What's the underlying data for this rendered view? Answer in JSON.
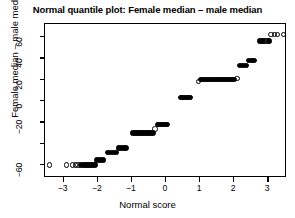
{
  "chart_data": {
    "type": "scatter",
    "title": "Normal quantile plot: Female median – male median",
    "xlabel": "Normal score",
    "ylabel": "Female median – male median",
    "xlim": [
      -3.55,
      3.55
    ],
    "ylim": [
      -72,
      72
    ],
    "grid": false,
    "legend": null,
    "xticks": [
      -3,
      -2,
      -1,
      0,
      1,
      2,
      3
    ],
    "xticklabels": [
      "−3",
      "−2",
      "−1",
      "0",
      "1",
      "2",
      "3"
    ],
    "yticks": [
      60,
      40,
      20,
      0,
      -20,
      -40,
      -60
    ],
    "yticklabels": [
      "60",
      "40",
      "20",
      "0",
      "−20",
      "",
      "−60"
    ],
    "marker": "open-circle",
    "marker_color": "#000000",
    "point_count": 118,
    "note": "Discrete response values produce horizontal bands of overlapping points forming a staircase.",
    "bands": [
      {
        "y": -60,
        "x_start": -3.42,
        "x_end": -3.42,
        "n": 1
      },
      {
        "y": -60,
        "x_start": -2.92,
        "x_end": -2.6,
        "n": 4
      },
      {
        "y": -60,
        "x_start": -2.5,
        "x_end": -2.08,
        "n": 9
      },
      {
        "y": -55,
        "x_start": -2.02,
        "x_end": -1.84,
        "n": 4
      },
      {
        "y": -48,
        "x_start": -1.72,
        "x_end": -1.46,
        "n": 5
      },
      {
        "y": -44,
        "x_start": -1.4,
        "x_end": -1.17,
        "n": 5
      },
      {
        "y": -30,
        "x_start": -0.98,
        "x_end": -0.38,
        "n": 13
      },
      {
        "y": -26,
        "x_start": -0.32,
        "x_end": -0.32,
        "n": 1
      },
      {
        "y": -22,
        "x_start": -0.25,
        "x_end": 0.05,
        "n": 7
      },
      {
        "y": 3,
        "x_start": 0.42,
        "x_end": 0.72,
        "n": 7
      },
      {
        "y": 18,
        "x_start": 0.95,
        "x_end": 0.95,
        "n": 1
      },
      {
        "y": 20,
        "x_start": 1.03,
        "x_end": 2.02,
        "n": 20
      },
      {
        "y": 21,
        "x_start": 2.08,
        "x_end": 2.08,
        "n": 1
      },
      {
        "y": 33,
        "x_start": 2.16,
        "x_end": 2.35,
        "n": 4
      },
      {
        "y": 38,
        "x_start": 2.42,
        "x_end": 2.58,
        "n": 4
      },
      {
        "y": 56,
        "x_start": 2.75,
        "x_end": 3.02,
        "n": 7
      },
      {
        "y": 60,
        "x_start": 2.86,
        "x_end": 2.98,
        "n": 3
      },
      {
        "y": 62,
        "x_start": 3.08,
        "x_end": 3.08,
        "n": 1
      },
      {
        "y": 62,
        "x_start": 3.18,
        "x_end": 3.18,
        "n": 1
      },
      {
        "y": 62,
        "x_start": 3.27,
        "x_end": 3.27,
        "n": 1
      },
      {
        "y": 62,
        "x_start": 3.45,
        "x_end": 3.45,
        "n": 1
      }
    ],
    "points": [
      {
        "x": -3.42,
        "y": -60,
        "filled": false
      },
      {
        "x": -2.92,
        "y": -60,
        "filled": false
      },
      {
        "x": -2.74,
        "y": -60,
        "filled": false
      },
      {
        "x": -2.66,
        "y": -60,
        "filled": false
      },
      {
        "x": -2.58,
        "y": -60,
        "filled": false
      },
      {
        "x": -2.5,
        "y": -60,
        "filled": true
      },
      {
        "x": -2.44,
        "y": -60,
        "filled": true
      },
      {
        "x": -2.38,
        "y": -60,
        "filled": true
      },
      {
        "x": -2.32,
        "y": -60,
        "filled": true
      },
      {
        "x": -2.26,
        "y": -60,
        "filled": true
      },
      {
        "x": -2.2,
        "y": -60,
        "filled": true
      },
      {
        "x": -2.14,
        "y": -60,
        "filled": true
      },
      {
        "x": -2.08,
        "y": -60,
        "filled": true
      },
      {
        "x": -2.02,
        "y": -55,
        "filled": true
      },
      {
        "x": -1.96,
        "y": -55,
        "filled": true
      },
      {
        "x": -1.9,
        "y": -55,
        "filled": true
      },
      {
        "x": -1.84,
        "y": -55,
        "filled": true
      },
      {
        "x": -1.72,
        "y": -48,
        "filled": true
      },
      {
        "x": -1.66,
        "y": -48,
        "filled": true
      },
      {
        "x": -1.6,
        "y": -48,
        "filled": true
      },
      {
        "x": -1.53,
        "y": -48,
        "filled": true
      },
      {
        "x": -1.46,
        "y": -48,
        "filled": true
      },
      {
        "x": -1.4,
        "y": -44,
        "filled": true
      },
      {
        "x": -1.34,
        "y": -44,
        "filled": true
      },
      {
        "x": -1.28,
        "y": -44,
        "filled": true
      },
      {
        "x": -1.22,
        "y": -44,
        "filled": true
      },
      {
        "x": -1.17,
        "y": -44,
        "filled": true
      },
      {
        "x": -0.98,
        "y": -30,
        "filled": true
      },
      {
        "x": -0.93,
        "y": -30,
        "filled": true
      },
      {
        "x": -0.88,
        "y": -30,
        "filled": true
      },
      {
        "x": -0.83,
        "y": -30,
        "filled": true
      },
      {
        "x": -0.78,
        "y": -30,
        "filled": true
      },
      {
        "x": -0.73,
        "y": -30,
        "filled": true
      },
      {
        "x": -0.68,
        "y": -30,
        "filled": true
      },
      {
        "x": -0.63,
        "y": -30,
        "filled": true
      },
      {
        "x": -0.58,
        "y": -30,
        "filled": true
      },
      {
        "x": -0.53,
        "y": -30,
        "filled": true
      },
      {
        "x": -0.48,
        "y": -30,
        "filled": true
      },
      {
        "x": -0.43,
        "y": -30,
        "filled": true
      },
      {
        "x": -0.38,
        "y": -30,
        "filled": true
      },
      {
        "x": -0.32,
        "y": -26,
        "filled": false
      },
      {
        "x": -0.25,
        "y": -22,
        "filled": true
      },
      {
        "x": -0.2,
        "y": -22,
        "filled": true
      },
      {
        "x": -0.15,
        "y": -22,
        "filled": true
      },
      {
        "x": -0.1,
        "y": -22,
        "filled": true
      },
      {
        "x": -0.05,
        "y": -22,
        "filled": true
      },
      {
        "x": 0.0,
        "y": -22,
        "filled": true
      },
      {
        "x": 0.05,
        "y": -22,
        "filled": true
      },
      {
        "x": 0.42,
        "y": 3,
        "filled": true
      },
      {
        "x": 0.47,
        "y": 3,
        "filled": true
      },
      {
        "x": 0.52,
        "y": 3,
        "filled": true
      },
      {
        "x": 0.57,
        "y": 3,
        "filled": true
      },
      {
        "x": 0.62,
        "y": 3,
        "filled": true
      },
      {
        "x": 0.67,
        "y": 3,
        "filled": true
      },
      {
        "x": 0.72,
        "y": 3,
        "filled": true
      },
      {
        "x": 0.95,
        "y": 18,
        "filled": false
      },
      {
        "x": 1.03,
        "y": 20,
        "filled": true
      },
      {
        "x": 1.08,
        "y": 20,
        "filled": true
      },
      {
        "x": 1.13,
        "y": 20,
        "filled": true
      },
      {
        "x": 1.18,
        "y": 20,
        "filled": true
      },
      {
        "x": 1.23,
        "y": 20,
        "filled": true
      },
      {
        "x": 1.28,
        "y": 20,
        "filled": true
      },
      {
        "x": 1.33,
        "y": 20,
        "filled": true
      },
      {
        "x": 1.38,
        "y": 20,
        "filled": true
      },
      {
        "x": 1.43,
        "y": 20,
        "filled": true
      },
      {
        "x": 1.48,
        "y": 20,
        "filled": true
      },
      {
        "x": 1.53,
        "y": 20,
        "filled": true
      },
      {
        "x": 1.58,
        "y": 20,
        "filled": true
      },
      {
        "x": 1.63,
        "y": 20,
        "filled": true
      },
      {
        "x": 1.68,
        "y": 20,
        "filled": true
      },
      {
        "x": 1.73,
        "y": 20,
        "filled": true
      },
      {
        "x": 1.78,
        "y": 20,
        "filled": true
      },
      {
        "x": 1.83,
        "y": 20,
        "filled": true
      },
      {
        "x": 1.88,
        "y": 20,
        "filled": true
      },
      {
        "x": 1.94,
        "y": 20,
        "filled": true
      },
      {
        "x": 2.0,
        "y": 20,
        "filled": true
      },
      {
        "x": 2.08,
        "y": 21,
        "filled": false
      },
      {
        "x": 2.16,
        "y": 33,
        "filled": true
      },
      {
        "x": 2.22,
        "y": 33,
        "filled": true
      },
      {
        "x": 2.28,
        "y": 33,
        "filled": true
      },
      {
        "x": 2.35,
        "y": 33,
        "filled": true
      },
      {
        "x": 2.42,
        "y": 38,
        "filled": true
      },
      {
        "x": 2.48,
        "y": 38,
        "filled": true
      },
      {
        "x": 2.53,
        "y": 38,
        "filled": true
      },
      {
        "x": 2.58,
        "y": 38,
        "filled": true
      },
      {
        "x": 2.75,
        "y": 56,
        "filled": true
      },
      {
        "x": 2.8,
        "y": 56,
        "filled": true
      },
      {
        "x": 2.85,
        "y": 56,
        "filled": true
      },
      {
        "x": 2.9,
        "y": 56,
        "filled": false
      },
      {
        "x": 2.95,
        "y": 56,
        "filled": false
      },
      {
        "x": 3.0,
        "y": 56,
        "filled": true
      },
      {
        "x": 3.04,
        "y": 56,
        "filled": true
      },
      {
        "x": 3.08,
        "y": 62,
        "filled": false
      },
      {
        "x": 3.18,
        "y": 62,
        "filled": false
      },
      {
        "x": 3.27,
        "y": 62,
        "filled": false
      },
      {
        "x": 3.45,
        "y": 62,
        "filled": false
      }
    ]
  }
}
